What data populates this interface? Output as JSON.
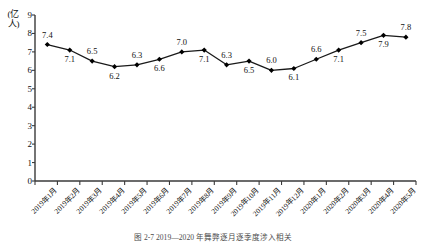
{
  "chart_data": {
    "type": "line",
    "title": "",
    "xlabel": "",
    "ylabel": "(亿人)",
    "unit": "亿人",
    "ylim": [
      0,
      9
    ],
    "yticks": [
      "9",
      "8",
      "7",
      "6",
      "5",
      "4",
      "3",
      "2",
      "1",
      "0"
    ],
    "grid": false,
    "legend": "none",
    "marker": "diamond",
    "categories": [
      "2019年1月",
      "2019年2月",
      "2019年3月",
      "2019年4月",
      "2019年5月",
      "2019年6月",
      "2019年7月",
      "2019年8月",
      "2019年9月",
      "2019年10月",
      "2019年11月",
      "2019年12月",
      "2020年1月",
      "2020年2月",
      "2020年3月",
      "2020年4月",
      "2020年5月"
    ],
    "values": [
      7.4,
      7.1,
      6.5,
      6.2,
      6.3,
      6.6,
      7.0,
      7.1,
      6.3,
      6.5,
      6.0,
      6.1,
      6.6,
      7.1,
      7.5,
      7.9,
      7.8
    ],
    "value_labels": [
      "7.4",
      "7.1",
      "6.5",
      "6.2",
      "6.3",
      "6.6",
      "7.0",
      "7.1",
      "6.3",
      "6.5",
      "6.0",
      "6.1",
      "6.6",
      "7.1",
      "7.5",
      "7.9",
      "7.8"
    ],
    "label_positions": [
      "above",
      "below",
      "above",
      "below",
      "above",
      "below",
      "above",
      "below",
      "above",
      "below",
      "above",
      "below",
      "above",
      "below",
      "above",
      "below",
      "above"
    ]
  },
  "caption": {
    "text": "图 2-7   2019—2020 年舞弊逐月逐季度涉入相关"
  },
  "colors": {
    "line": "#1a1a1a",
    "marker": "#000000",
    "axis": "#3a3a3a",
    "background": "#ffffff"
  }
}
